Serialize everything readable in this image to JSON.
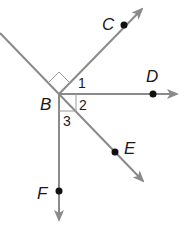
{
  "diagram": {
    "vertex": {
      "label": "B",
      "x": 59,
      "y": 94
    },
    "rays": [
      {
        "name": "C",
        "label": "C",
        "point": [
          124,
          25
        ],
        "tip": [
          142,
          9
        ]
      },
      {
        "name": "D",
        "label": "D",
        "point": [
          153,
          94
        ],
        "tip": [
          177,
          94
        ]
      },
      {
        "name": "E",
        "label": "E",
        "point": [
          115,
          152
        ],
        "tip": [
          143,
          181
        ]
      },
      {
        "name": "F",
        "label": "F",
        "point": [
          59,
          191
        ],
        "tip": [
          59,
          220
        ]
      }
    ],
    "angles": [
      {
        "label": "1"
      },
      {
        "label": "2"
      },
      {
        "label": "3"
      }
    ],
    "colors": {
      "line": "#8a8a8a",
      "point": "#111111",
      "text": "#1a1a1a"
    }
  }
}
